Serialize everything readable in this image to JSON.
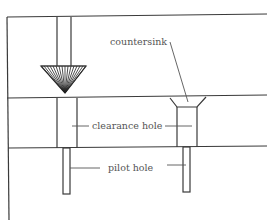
{
  "diagram": {
    "type": "cross-section",
    "labels": {
      "countersink": "countersink",
      "clearance_hole": "clearance hole",
      "pilot_hole": "pilot hole"
    },
    "colors": {
      "line": "#3a3a3a",
      "label": "#555555",
      "background": "#ffffff"
    }
  }
}
